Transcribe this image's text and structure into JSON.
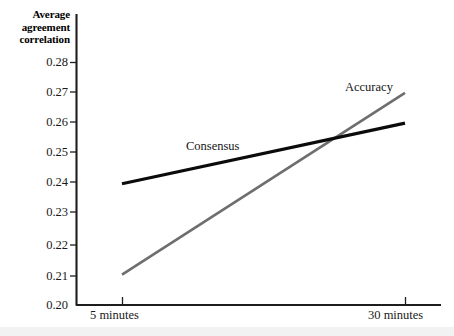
{
  "figure": {
    "background_color": "#ffffff",
    "bottom_band_color": "#f2f2f2"
  },
  "chart_data": {
    "type": "line",
    "title": "",
    "subtitle": "",
    "xlabel": "",
    "ylabel": "Average agreement correlation",
    "ylabel_lines": [
      "Average",
      "agreement",
      "correlation"
    ],
    "categories": [
      "5 minutes",
      "30 minutes"
    ],
    "x_tick_labels": [
      "5 minutes",
      "30 minutes"
    ],
    "y_tick_labels": [
      "0.28",
      "0.27",
      "0.26",
      "0.25",
      "0.24",
      "0.23",
      "0.22",
      "0.21",
      "0.20"
    ],
    "y_tick_values": [
      0.28,
      0.27,
      0.26,
      0.25,
      0.24,
      0.23,
      0.22,
      0.21,
      0.2
    ],
    "ylim": [
      0.2,
      0.285
    ],
    "grid": false,
    "legend_position": "inline-annotation",
    "series": [
      {
        "name": "Consensus",
        "color": "#0b0b0b",
        "line_width": 3.1,
        "values": [
          0.24,
          0.26
        ],
        "label_text": "Consensus"
      },
      {
        "name": "Accuracy",
        "color": "#6e6e6e",
        "line_width": 2.6,
        "values": [
          0.21,
          0.27
        ],
        "label_text": "Accuracy"
      }
    ],
    "annotations": [
      {
        "text": "Consensus",
        "series": "Consensus"
      },
      {
        "text": "Accuracy",
        "series": "Accuracy"
      }
    ]
  },
  "axis": {
    "color": "#1d1d1d",
    "y_axis_label_0": "0.28",
    "y_axis_label_1": "0.27",
    "y_axis_label_2": "0.26",
    "y_axis_label_3": "0.25",
    "y_axis_label_4": "0.24",
    "y_axis_label_5": "0.23",
    "y_axis_label_6": "0.22",
    "y_axis_label_7": "0.21",
    "y_axis_label_8": "0.20",
    "x_axis_label_left": "5 minutes",
    "x_axis_label_right": "30 minutes"
  }
}
